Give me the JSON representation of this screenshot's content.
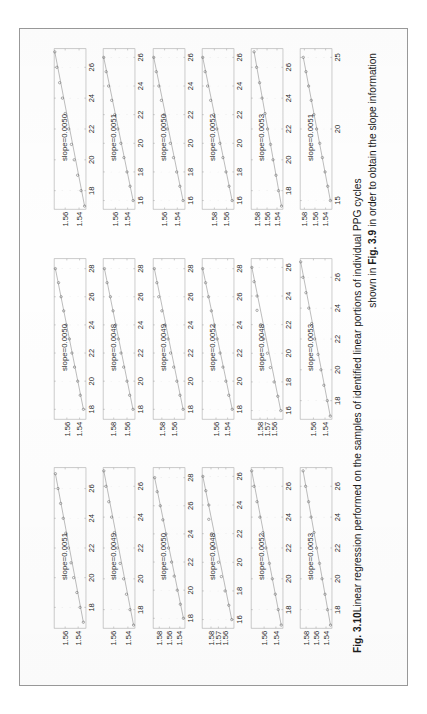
{
  "figure": {
    "label": "Fig. 3.10",
    "caption_line_1_bold": "Fig. 3.10",
    "caption_line_1_text": "Linear regression performed on the samples of  identified linear portions of individual PPG cycles",
    "caption_line_2_pre": "shown in ",
    "caption_line_2_bold": "Fig. 3.9",
    "caption_line_2_post": " in order to obtain the slope information",
    "rows": 6,
    "columns": 3,
    "marker_style": "open-circle",
    "fit_line_color": "#8a8a8a",
    "axis_color": "#9e9e9e",
    "text_color": "#2a2a2a"
  },
  "chart_data": [
    {
      "type": "scatter",
      "id": "c1r1",
      "title": "",
      "annotation": "slope=0.0051",
      "slope": 0.0051,
      "xlabel": "",
      "ylabel": "",
      "xticks": [
        18,
        20,
        22,
        24,
        26
      ],
      "yticks": [
        1.54,
        1.56
      ],
      "xlim": [
        16.6,
        27.4
      ],
      "ylim": [
        1.528,
        1.577
      ],
      "x": [
        17,
        18,
        19,
        20,
        21,
        22,
        23,
        24,
        25,
        26,
        27
      ],
      "y": [
        1.532,
        1.537,
        1.542,
        1.547,
        1.551,
        1.555,
        1.559,
        1.563,
        1.567,
        1.571,
        1.575
      ],
      "grid": true,
      "legend": false
    },
    {
      "type": "scatter",
      "id": "c2r1",
      "title": "",
      "annotation": "slope=0.0050",
      "slope": 0.005,
      "xlabel": "",
      "ylabel": "",
      "xticks": [
        18,
        20,
        22,
        24,
        26,
        28
      ],
      "yticks": [
        1.54,
        1.56
      ],
      "xlim": [
        17.3,
        28.7
      ],
      "ylim": [
        1.53,
        1.58
      ],
      "x": [
        18,
        19,
        20,
        21,
        22,
        23,
        24,
        25,
        26,
        27,
        28
      ],
      "y": [
        1.534,
        1.539,
        1.543,
        1.548,
        1.552,
        1.556,
        1.561,
        1.565,
        1.569,
        1.573,
        1.578
      ],
      "grid": true,
      "legend": false
    },
    {
      "type": "scatter",
      "id": "c3r1",
      "title": "",
      "annotation": "slope=0.0050",
      "slope": 0.005,
      "xlabel": "",
      "ylabel": "",
      "xticks": [
        18,
        20,
        22,
        24,
        26
      ],
      "yticks": [
        1.54,
        1.56
      ],
      "xlim": [
        16.8,
        27.2
      ],
      "ylim": [
        1.53,
        1.576
      ],
      "x": [
        17,
        18,
        19,
        20,
        21,
        22,
        23,
        24,
        25,
        26,
        27
      ],
      "y": [
        1.532,
        1.537,
        1.542,
        1.547,
        1.551,
        1.555,
        1.56,
        1.564,
        1.568,
        1.572,
        1.575
      ],
      "grid": true,
      "legend": false
    },
    {
      "type": "scatter",
      "id": "c1r2",
      "title": "",
      "annotation": "slope=0.0049",
      "slope": 0.0049,
      "xlabel": "",
      "ylabel": "",
      "xticks": [
        18,
        20,
        22,
        24,
        26
      ],
      "yticks": [
        1.54,
        1.56
      ],
      "xlim": [
        16.8,
        27.2
      ],
      "ylim": [
        1.53,
        1.575
      ],
      "x": [
        17,
        18,
        19,
        20,
        21,
        22,
        23,
        24,
        25,
        26,
        27
      ],
      "y": [
        1.532,
        1.537,
        1.542,
        1.546,
        1.551,
        1.555,
        1.559,
        1.563,
        1.567,
        1.571,
        1.574
      ],
      "grid": true,
      "legend": false
    },
    {
      "type": "scatter",
      "id": "c2r2",
      "title": "",
      "annotation": "slope=0.0048",
      "slope": 0.0048,
      "xlabel": "",
      "ylabel": "",
      "xticks": [
        18,
        20,
        22,
        24,
        26,
        28
      ],
      "yticks": [
        1.56,
        1.58
      ],
      "xlim": [
        17.3,
        28.7
      ],
      "ylim": [
        1.548,
        1.596
      ],
      "x": [
        18,
        19,
        20,
        21,
        22,
        23,
        24,
        25,
        26,
        27,
        28
      ],
      "y": [
        1.551,
        1.556,
        1.56,
        1.565,
        1.569,
        1.573,
        1.577,
        1.581,
        1.585,
        1.59,
        1.594
      ],
      "grid": true,
      "legend": false
    },
    {
      "type": "scatter",
      "id": "c3r2",
      "title": "",
      "annotation": "slope=0.0051",
      "slope": 0.0051,
      "xlabel": "",
      "ylabel": "",
      "xticks": [
        16,
        18,
        20,
        22,
        24,
        26
      ],
      "yticks": [
        1.54,
        1.56
      ],
      "xlim": [
        15.4,
        26.6
      ],
      "ylim": [
        1.528,
        1.58
      ],
      "x": [
        16,
        17,
        18,
        19,
        20,
        21,
        22,
        23,
        24,
        25,
        26
      ],
      "y": [
        1.531,
        1.536,
        1.541,
        1.546,
        1.551,
        1.556,
        1.561,
        1.566,
        1.571,
        1.575,
        1.579
      ],
      "grid": true,
      "legend": false
    },
    {
      "type": "scatter",
      "id": "c1r3",
      "title": "",
      "annotation": "slope=0.0050",
      "slope": 0.005,
      "xlabel": "",
      "ylabel": "",
      "xticks": [
        18,
        20,
        22,
        24,
        26,
        28
      ],
      "yticks": [
        1.54,
        1.56,
        1.58
      ],
      "xlim": [
        17.3,
        28.7
      ],
      "ylim": [
        1.53,
        1.592
      ],
      "x": [
        18,
        19,
        20,
        21,
        22,
        23,
        24,
        25,
        26,
        27,
        28
      ],
      "y": [
        1.533,
        1.539,
        1.545,
        1.551,
        1.556,
        1.562,
        1.567,
        1.573,
        1.578,
        1.584,
        1.589
      ],
      "grid": true,
      "legend": false
    },
    {
      "type": "scatter",
      "id": "c2r3",
      "title": "",
      "annotation": "slope=0.0049",
      "slope": 0.0049,
      "xlabel": "",
      "ylabel": "",
      "xticks": [
        18,
        20,
        22,
        24,
        26,
        28
      ],
      "yticks": [
        1.56,
        1.58
      ],
      "xlim": [
        17.3,
        28.7
      ],
      "ylim": [
        1.543,
        1.594
      ],
      "x": [
        18,
        19,
        20,
        21,
        22,
        23,
        24,
        25,
        26,
        27,
        28
      ],
      "y": [
        1.546,
        1.551,
        1.556,
        1.561,
        1.566,
        1.57,
        1.575,
        1.58,
        1.585,
        1.588,
        1.592
      ],
      "grid": true,
      "legend": false
    },
    {
      "type": "scatter",
      "id": "c3r3",
      "title": "",
      "annotation": "slope=0.0050",
      "slope": 0.005,
      "xlabel": "",
      "ylabel": "",
      "xticks": [
        16,
        18,
        20,
        22,
        24,
        26
      ],
      "yticks": [
        1.54,
        1.56
      ],
      "xlim": [
        15.4,
        26.6
      ],
      "ylim": [
        1.528,
        1.578
      ],
      "x": [
        16,
        17,
        18,
        19,
        20,
        21,
        22,
        23,
        24,
        25,
        26
      ],
      "y": [
        1.531,
        1.536,
        1.541,
        1.546,
        1.551,
        1.556,
        1.561,
        1.565,
        1.569,
        1.573,
        1.577
      ],
      "grid": true,
      "legend": false
    },
    {
      "type": "scatter",
      "id": "c1r4",
      "title": "",
      "annotation": "slope=0.0048",
      "slope": 0.0048,
      "xlabel": "",
      "ylabel": "",
      "xticks": [
        16,
        18,
        20,
        22,
        24,
        26
      ],
      "yticks": [
        1.56,
        1.57,
        1.58
      ],
      "xlim": [
        15.4,
        26.6
      ],
      "ylim": [
        1.549,
        1.592
      ],
      "x": [
        16,
        17,
        18,
        19,
        20,
        21,
        22,
        23,
        24,
        25,
        26
      ],
      "y": [
        1.552,
        1.556,
        1.561,
        1.566,
        1.57,
        1.575,
        1.579,
        1.583,
        1.583,
        1.587,
        1.591
      ],
      "grid": true,
      "legend": false
    },
    {
      "type": "scatter",
      "id": "c2r4",
      "title": "",
      "annotation": "slope=0.0052",
      "slope": 0.0052,
      "xlabel": "",
      "ylabel": "",
      "xticks": [
        18,
        20,
        22,
        24,
        26,
        28
      ],
      "yticks": [
        1.54,
        1.56
      ],
      "xlim": [
        17.3,
        28.7
      ],
      "ylim": [
        1.529,
        1.584
      ],
      "x": [
        18,
        19,
        20,
        21,
        22,
        23,
        24,
        25,
        26,
        27,
        28
      ],
      "y": [
        1.532,
        1.538,
        1.543,
        1.548,
        1.553,
        1.558,
        1.563,
        1.568,
        1.573,
        1.578,
        1.583
      ],
      "grid": true,
      "legend": false
    },
    {
      "type": "scatter",
      "id": "c3r4",
      "title": "",
      "annotation": "slope=0.0052",
      "slope": 0.0052,
      "xlabel": "",
      "ylabel": "",
      "xticks": [
        16,
        18,
        20,
        22,
        24,
        26
      ],
      "yticks": [
        1.56,
        1.58
      ],
      "xlim": [
        15.4,
        26.6
      ],
      "ylim": [
        1.548,
        1.6
      ],
      "x": [
        16,
        17,
        18,
        19,
        20,
        21,
        22,
        23,
        24,
        25,
        26
      ],
      "y": [
        1.551,
        1.556,
        1.561,
        1.566,
        1.571,
        1.576,
        1.581,
        1.586,
        1.591,
        1.595,
        1.599
      ],
      "grid": true,
      "legend": false
    },
    {
      "type": "scatter",
      "id": "c1r5",
      "title": "",
      "annotation": "slope=0.0052",
      "slope": 0.0052,
      "xlabel": "",
      "ylabel": "",
      "xticks": [
        18,
        20,
        22,
        24,
        26
      ],
      "yticks": [
        1.54,
        1.56
      ],
      "xlim": [
        16.8,
        27.2
      ],
      "ylim": [
        1.528,
        1.582
      ],
      "x": [
        17,
        18,
        19,
        20,
        21,
        22,
        23,
        24,
        25,
        26,
        27
      ],
      "y": [
        1.531,
        1.536,
        1.541,
        1.546,
        1.551,
        1.557,
        1.562,
        1.567,
        1.572,
        1.577,
        1.581
      ],
      "grid": true,
      "legend": false
    },
    {
      "type": "scatter",
      "id": "c2r5",
      "title": "",
      "annotation": "slope=0.0048",
      "slope": 0.0048,
      "xlabel": "",
      "ylabel": "",
      "xticks": [
        16,
        18,
        20,
        22,
        24,
        26
      ],
      "yticks": [
        1.56,
        1.57,
        1.58
      ],
      "xlim": [
        15.4,
        26.6
      ],
      "ylim": [
        1.549,
        1.592
      ],
      "x": [
        16,
        17,
        18,
        19,
        20,
        21,
        22,
        23,
        24,
        25,
        26
      ],
      "y": [
        1.552,
        1.556,
        1.561,
        1.566,
        1.57,
        1.575,
        1.579,
        1.584,
        1.584,
        1.588,
        1.591
      ],
      "grid": true,
      "legend": false
    },
    {
      "type": "scatter",
      "id": "c3r5",
      "title": "",
      "annotation": "slope=0.0053",
      "slope": 0.0053,
      "xlabel": "",
      "ylabel": "",
      "xticks": [
        18,
        20,
        22,
        24,
        26
      ],
      "yticks": [
        1.54,
        1.56,
        1.58
      ],
      "xlim": [
        16.8,
        27.2
      ],
      "ylim": [
        1.528,
        1.592
      ],
      "x": [
        17,
        18,
        19,
        20,
        21,
        22,
        23,
        24,
        25,
        26,
        27
      ],
      "y": [
        1.531,
        1.537,
        1.542,
        1.548,
        1.553,
        1.559,
        1.564,
        1.57,
        1.575,
        1.581,
        1.586
      ],
      "grid": true,
      "legend": false
    },
    {
      "type": "scatter",
      "id": "c1r6",
      "title": "",
      "annotation": "slope=0.0053",
      "slope": 0.0053,
      "xlabel": "",
      "ylabel": "",
      "xticks": [
        18,
        20,
        22,
        24,
        26
      ],
      "yticks": [
        1.54,
        1.56,
        1.58
      ],
      "xlim": [
        16.8,
        27.2
      ],
      "ylim": [
        1.528,
        1.592
      ],
      "x": [
        17,
        18,
        19,
        20,
        21,
        22,
        23,
        24,
        25,
        26,
        27
      ],
      "y": [
        1.531,
        1.537,
        1.542,
        1.548,
        1.553,
        1.559,
        1.564,
        1.57,
        1.575,
        1.581,
        1.586
      ],
      "grid": true,
      "legend": false
    },
    {
      "type": "scatter",
      "id": "c2r6",
      "title": "",
      "annotation": "slope=0.0053",
      "slope": 0.0053,
      "xlabel": "",
      "ylabel": "",
      "xticks": [
        18,
        20,
        22,
        24,
        26
      ],
      "yticks": [
        1.54,
        1.56
      ],
      "xlim": [
        16.8,
        27.2
      ],
      "ylim": [
        1.528,
        1.583
      ],
      "x": [
        17,
        18,
        19,
        20,
        21,
        22,
        23,
        24,
        25,
        26,
        27
      ],
      "y": [
        1.531,
        1.536,
        1.542,
        1.547,
        1.552,
        1.558,
        1.563,
        1.568,
        1.573,
        1.578,
        1.582
      ],
      "grid": true,
      "legend": false
    },
    {
      "type": "scatter",
      "id": "c3r6",
      "title": "",
      "annotation": "slope=0.0051",
      "slope": 0.0051,
      "xlabel": "",
      "ylabel": "",
      "xticks": [
        15,
        20,
        25
      ],
      "yticks": [
        1.54,
        1.56,
        1.58
      ],
      "xlim": [
        14.4,
        25.6
      ],
      "ylim": [
        1.528,
        1.588
      ],
      "x": [
        15,
        16,
        17,
        18,
        19,
        20,
        21,
        22,
        23,
        24,
        25
      ],
      "y": [
        1.531,
        1.536,
        1.541,
        1.546,
        1.551,
        1.557,
        1.562,
        1.567,
        1.572,
        1.577,
        1.582
      ],
      "grid": true,
      "legend": false
    }
  ]
}
